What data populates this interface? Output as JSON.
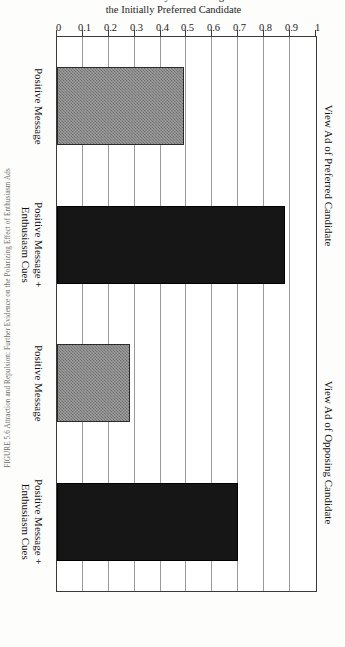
{
  "figure": {
    "caption": "FIGURE 5.6  Attraction and Repulsion: Further Evidence on the Polarizing Effect of Enthusiasm Ads"
  },
  "chart_data": {
    "type": "bar",
    "orientation": "horizontal",
    "title": "",
    "xlabel": "",
    "ylabel": "Probability of Choosing the Initially Preferred Candidate",
    "ylabel_line1": "Probability of Choosing",
    "ylabel_line2": "the Initially Preferred Candidate",
    "ylim": [
      0,
      1
    ],
    "grid": true,
    "grid_axis": "value",
    "legend": "none",
    "tick_labels": [
      "1",
      "0.9",
      "0.8",
      "0.7",
      "0.6",
      "0.5",
      "0.4",
      "0.3",
      "0.2",
      "0.1",
      "0"
    ],
    "tick_values": [
      1,
      0.9,
      0.8,
      0.7,
      0.6,
      0.5,
      0.4,
      0.3,
      0.2,
      0.1,
      0
    ],
    "groups": [
      {
        "label": "View Ad of Preferred Candidate",
        "categories": [
          "Positive Message",
          "Positive Message +\nEnthusiasm Cues"
        ]
      },
      {
        "label": "View Ad of Opposing Candidate",
        "categories": [
          "Positive Message",
          "Positive Message +\nEnthusiasm Cues"
        ]
      }
    ],
    "categories": [
      "Positive Message",
      "Positive Message + Enthusiasm Cues",
      "Positive Message",
      "Positive Message + Enthusiasm Cues"
    ],
    "values": [
      0.49,
      0.88,
      0.28,
      0.7
    ],
    "bars": [
      {
        "category_line1": "Positive Message",
        "category_line2": "",
        "group": "View Ad of Preferred Candidate",
        "value": 0.49,
        "fill": "hatched"
      },
      {
        "category_line1": "Positive Message +",
        "category_line2": "Enthusiasm Cues",
        "group": "View Ad of Preferred Candidate",
        "value": 0.88,
        "fill": "solid"
      },
      {
        "category_line1": "Positive Message",
        "category_line2": "",
        "group": "View Ad of Opposing Candidate",
        "value": 0.28,
        "fill": "hatched"
      },
      {
        "category_line1": "Positive Message +",
        "category_line2": "Enthusiasm Cues",
        "group": "View Ad of Opposing Candidate",
        "value": 0.7,
        "fill": "solid"
      }
    ],
    "colors": {
      "solid": "#161616",
      "hatched": "#9d9d9d",
      "axis": "#3a3a3a",
      "grid": "#9a9a9a"
    }
  }
}
